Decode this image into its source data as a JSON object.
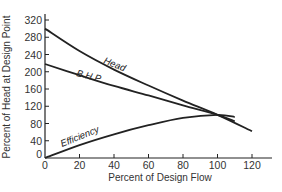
{
  "chart_data": {
    "type": "line",
    "title": "",
    "xlabel": "Percent of Design Flow",
    "ylabel": "Percent of Head at Design Point",
    "xlim": [
      0,
      130
    ],
    "ylim": [
      0,
      340
    ],
    "xticks": [
      0,
      20,
      40,
      60,
      80,
      100,
      120
    ],
    "yticks": [
      0,
      40,
      80,
      120,
      160,
      200,
      240,
      280,
      320
    ],
    "grid": false,
    "legend": "none (curves labeled inline)",
    "series": [
      {
        "name": "Head",
        "x": [
          0,
          20,
          40,
          60,
          80,
          100,
          120
        ],
        "y": [
          300,
          248,
          205,
          168,
          133,
          100,
          62
        ]
      },
      {
        "name": "B.H.P",
        "x": [
          0,
          20,
          40,
          60,
          80,
          100,
          110
        ],
        "y": [
          218,
          192,
          167,
          145,
          122,
          100,
          85
        ]
      },
      {
        "name": "Efficiency",
        "x": [
          0,
          20,
          40,
          60,
          80,
          100,
          110
        ],
        "y": [
          0,
          30,
          55,
          76,
          93,
          100,
          95
        ]
      }
    ],
    "annotations": [
      {
        "text": "Head",
        "near": "Head curve around x=45"
      },
      {
        "text": "B.H.P",
        "near": "B.H.P curve around x=30"
      },
      {
        "text": "Efficiency",
        "near": "Efficiency curve around x=20"
      }
    ]
  },
  "labels": {
    "xlabel": "Percent of Design Flow",
    "ylabel": "Percent of Head at Design Point",
    "head": "Head",
    "bhp": "B.H.P",
    "efficiency": "Efficiency"
  },
  "ticks": {
    "x": [
      "0",
      "20",
      "40",
      "60",
      "80",
      "100",
      "120"
    ],
    "y": [
      "0",
      "40",
      "80",
      "120",
      "160",
      "200",
      "240",
      "280",
      "320"
    ]
  }
}
